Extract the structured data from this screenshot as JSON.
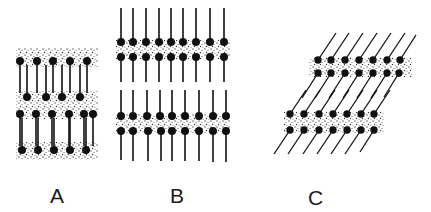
{
  "figure": {
    "colors": {
      "ink": "#111111",
      "stipple": "#555555",
      "background": "#ffffff"
    },
    "panels": [
      {
        "id": "A",
        "label": "A",
        "arrangement": "interdigitated chains between stippled head-group layers"
      },
      {
        "id": "B",
        "label": "B",
        "arrangement": "perpendicular bilayers with chains extending outward"
      },
      {
        "id": "C",
        "label": "C",
        "arrangement": "tilted bilayers with chains slanted"
      }
    ]
  }
}
